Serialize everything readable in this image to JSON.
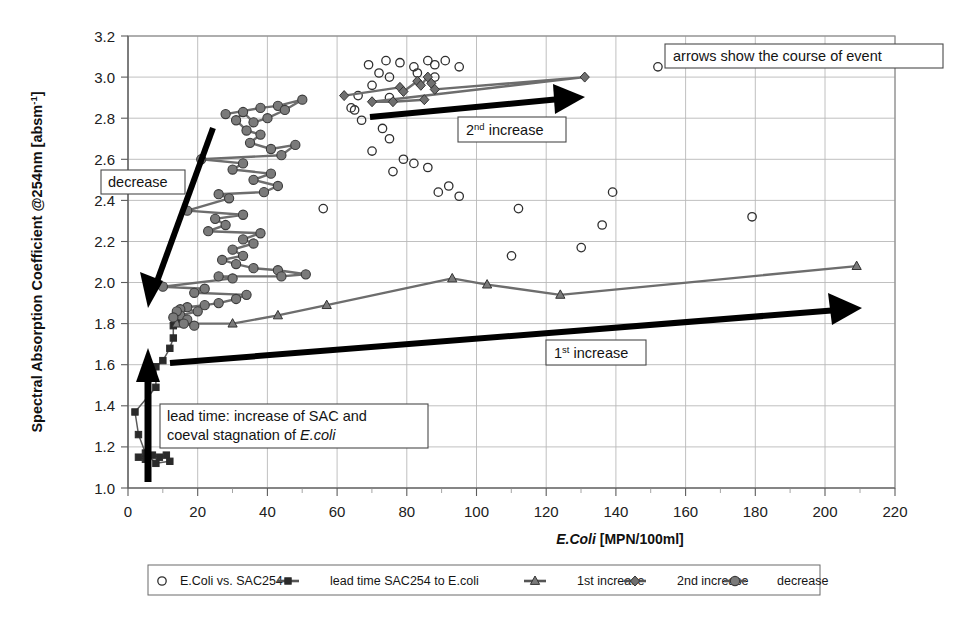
{
  "chart_data": {
    "type": "scatter",
    "title": "",
    "xlabel": "E.Coli [MPN/100ml]",
    "ylabel": "Spectral Absorption Coefficient @254nm [absm-1]",
    "ylabel_main": "Spectral Absorption Coefficient @254nm [absm",
    "ylabel_sup": "-1",
    "ylabel_tail": "]",
    "xlabel_italic": "E.Coli",
    "xlabel_rest": " [MPN/100ml]",
    "xlim": [
      0,
      220
    ],
    "ylim": [
      1.0,
      3.2
    ],
    "xticks": [
      0,
      20,
      40,
      60,
      80,
      100,
      120,
      140,
      160,
      180,
      200,
      220
    ],
    "yticks": [
      1.0,
      1.2,
      1.4,
      1.6,
      1.8,
      2.0,
      2.2,
      2.4,
      2.6,
      2.8,
      3.0,
      3.2
    ],
    "ytick_labels": [
      "1.0",
      "1.2",
      "1.4",
      "1.6",
      "1.8",
      "2.0",
      "2.2",
      "2.4",
      "2.6",
      "2.8",
      "3.0",
      "3.2"
    ],
    "xtick_labels": [
      "0",
      "20",
      "40",
      "60",
      "80",
      "100",
      "120",
      "140",
      "160",
      "180",
      "200",
      "220"
    ],
    "grid": true,
    "legend_position": "bottom",
    "series": [
      {
        "name": "E.Coli vs. SAC254",
        "marker": "open-circle",
        "line": false,
        "color": "#2f2f2f",
        "points": [
          [
            69,
            3.06
          ],
          [
            74,
            3.08
          ],
          [
            78,
            3.07
          ],
          [
            82,
            3.05
          ],
          [
            86,
            3.08
          ],
          [
            88,
            3.06
          ],
          [
            91,
            3.08
          ],
          [
            95,
            3.05
          ],
          [
            83,
            3.02
          ],
          [
            88,
            3.0
          ],
          [
            75,
            3.0
          ],
          [
            72,
            3.02
          ],
          [
            70,
            2.96
          ],
          [
            66,
            2.91
          ],
          [
            75,
            2.9
          ],
          [
            64,
            2.85
          ],
          [
            65,
            2.84
          ],
          [
            67,
            2.79
          ],
          [
            73,
            2.75
          ],
          [
            75,
            2.7
          ],
          [
            70,
            2.64
          ],
          [
            79,
            2.6
          ],
          [
            82,
            2.58
          ],
          [
            86,
            2.56
          ],
          [
            76,
            2.54
          ],
          [
            92,
            2.47
          ],
          [
            89,
            2.44
          ],
          [
            95,
            2.42
          ],
          [
            112,
            2.36
          ],
          [
            110,
            2.13
          ],
          [
            152,
            3.05
          ],
          [
            139,
            2.44
          ],
          [
            136,
            2.28
          ],
          [
            130,
            2.17
          ],
          [
            179,
            2.32
          ],
          [
            56,
            2.36
          ]
        ]
      },
      {
        "name": "lead time SAC254 to E.coli",
        "marker": "square",
        "line": true,
        "color": "#2a2a2a",
        "points": [
          [
            3,
            1.15
          ],
          [
            5,
            1.14
          ],
          [
            7,
            1.16
          ],
          [
            9,
            1.15
          ],
          [
            11,
            1.16
          ],
          [
            12,
            1.13
          ],
          [
            8,
            1.12
          ],
          [
            5,
            1.17
          ],
          [
            3,
            1.26
          ],
          [
            2,
            1.37
          ],
          [
            8,
            1.49
          ],
          [
            8,
            1.59
          ],
          [
            10,
            1.62
          ],
          [
            12,
            1.68
          ],
          [
            13,
            1.73
          ],
          [
            13,
            1.79
          ],
          [
            14,
            1.82
          ]
        ]
      },
      {
        "name": "1st increase",
        "marker": "triangle",
        "line": true,
        "color": "#7a7a7a",
        "points": [
          [
            14,
            1.8
          ],
          [
            30,
            1.8
          ],
          [
            43,
            1.84
          ],
          [
            57,
            1.89
          ],
          [
            93,
            2.02
          ],
          [
            103,
            1.99
          ],
          [
            124,
            1.94
          ],
          [
            209,
            2.08
          ]
        ]
      },
      {
        "name": "2nd increase",
        "marker": "diamond",
        "line": true,
        "color": "#6f6f6f",
        "points": [
          [
            62,
            2.91
          ],
          [
            78,
            2.95
          ],
          [
            79,
            2.93
          ],
          [
            83,
            2.98
          ],
          [
            84,
            2.96
          ],
          [
            86,
            3.0
          ],
          [
            87,
            2.97
          ],
          [
            88,
            2.94
          ],
          [
            131,
            3.0
          ],
          [
            70,
            2.88
          ],
          [
            76,
            2.88
          ],
          [
            85,
            2.89
          ]
        ]
      },
      {
        "name": "decrease",
        "marker": "circle",
        "line": true,
        "color": "#6d6d6d",
        "points": [
          [
            28,
            2.82
          ],
          [
            38,
            2.85
          ],
          [
            43,
            2.86
          ],
          [
            50,
            2.89
          ],
          [
            45,
            2.84
          ],
          [
            40,
            2.8
          ],
          [
            36,
            2.78
          ],
          [
            33,
            2.83
          ],
          [
            31,
            2.79
          ],
          [
            34,
            2.74
          ],
          [
            38,
            2.72
          ],
          [
            35,
            2.68
          ],
          [
            41,
            2.65
          ],
          [
            48,
            2.67
          ],
          [
            44,
            2.62
          ],
          [
            21,
            2.6
          ],
          [
            33,
            2.58
          ],
          [
            30,
            2.55
          ],
          [
            41,
            2.53
          ],
          [
            36,
            2.5
          ],
          [
            43,
            2.47
          ],
          [
            39,
            2.44
          ],
          [
            26,
            2.43
          ],
          [
            29,
            2.41
          ],
          [
            17,
            2.35
          ],
          [
            33,
            2.33
          ],
          [
            25,
            2.31
          ],
          [
            28,
            2.28
          ],
          [
            23,
            2.25
          ],
          [
            38,
            2.24
          ],
          [
            33,
            2.21
          ],
          [
            36,
            2.19
          ],
          [
            30,
            2.16
          ],
          [
            33,
            2.13
          ],
          [
            27,
            2.11
          ],
          [
            31,
            2.09
          ],
          [
            36,
            2.07
          ],
          [
            43,
            2.06
          ],
          [
            51,
            2.04
          ],
          [
            44,
            2.03
          ],
          [
            26,
            2.03
          ],
          [
            30,
            2.02
          ],
          [
            10,
            1.98
          ],
          [
            22,
            1.97
          ],
          [
            19,
            1.95
          ],
          [
            34,
            1.94
          ],
          [
            31,
            1.92
          ],
          [
            26,
            1.9
          ],
          [
            22,
            1.89
          ],
          [
            17,
            1.88
          ],
          [
            15,
            1.87
          ],
          [
            20,
            1.86
          ],
          [
            15,
            1.84
          ],
          [
            17,
            1.82
          ],
          [
            16,
            1.8
          ],
          [
            19,
            1.79
          ],
          [
            14,
            1.86
          ],
          [
            13,
            1.83
          ]
        ]
      }
    ],
    "annotations": [
      {
        "id": "course-of-event",
        "text": "arrows show the course of event",
        "boxed": true
      },
      {
        "id": "second-increase",
        "text_main": "2",
        "text_sup": "nd",
        "text_tail": " increase",
        "boxed": true
      },
      {
        "id": "first-increase",
        "text_main": "1",
        "text_sup": "st",
        "text_tail": " increase",
        "boxed": true
      },
      {
        "id": "decrease",
        "text": "decrease",
        "boxed": true
      },
      {
        "id": "lead-time",
        "line1": "lead time: increase of SAC and",
        "line2_pre": "coeval stagnation of ",
        "line2_italic": "E.coli",
        "boxed": true
      }
    ]
  },
  "legend": {
    "items": [
      {
        "label": "E.Coli vs. SAC254",
        "marker": "open-circle"
      },
      {
        "label": "lead time SAC254 to E.coli",
        "marker": "square-line"
      },
      {
        "label": "1st increase",
        "marker": "triangle-line"
      },
      {
        "label": "2nd increase",
        "marker": "diamond-line"
      },
      {
        "label": "decrease",
        "marker": "circle-line"
      }
    ]
  }
}
